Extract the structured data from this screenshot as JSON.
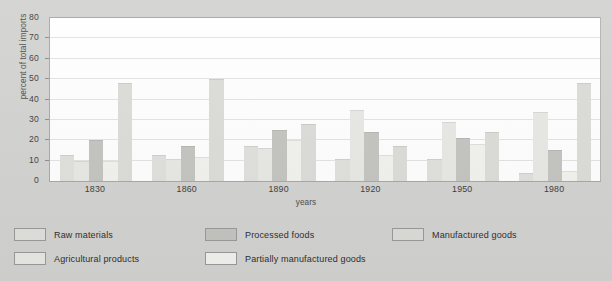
{
  "chart_data": {
    "type": "bar",
    "title": "",
    "subtitle": "",
    "xlabel": "years",
    "ylabel": "percent of total imports",
    "categories": [
      "1830",
      "1860",
      "1890",
      "1920",
      "1950",
      "1980"
    ],
    "ylim": [
      0,
      80
    ],
    "yticks": [
      0,
      10,
      20,
      30,
      40,
      50,
      60,
      70,
      80
    ],
    "ytick_labels": [
      "0",
      "10",
      "20",
      "30",
      "40",
      "50",
      "60",
      "70",
      "80"
    ],
    "grid": "horizontal",
    "legend_position": "below-plot",
    "series": [
      {
        "name": "Raw materials",
        "color": "#e0e0dc",
        "values": [
          13,
          13,
          17,
          11,
          11,
          4
        ]
      },
      {
        "name": "Agricultural products",
        "color": "#e8e8e4",
        "values": [
          10,
          11,
          16,
          35,
          29,
          34
        ]
      },
      {
        "name": "Processed foods",
        "color": "#c4c4c0",
        "values": [
          20,
          17,
          25,
          24,
          21,
          15
        ]
      },
      {
        "name": "Partially manufactured goods",
        "color": "#f2f2ee",
        "values": [
          10,
          12,
          20,
          13,
          18,
          5
        ]
      },
      {
        "name": "Manufactured goods",
        "color": "#dcdcd8",
        "values": [
          48,
          50,
          28,
          17,
          24,
          48
        ]
      }
    ]
  },
  "legend": {
    "items": [
      {
        "label": "Raw materials",
        "color": "#e0e0dc"
      },
      {
        "label": "Agricultural products",
        "color": "#e8e8e4"
      },
      {
        "label": "Processed foods",
        "color": "#c4c4c0"
      },
      {
        "label": "Partially manufactured goods",
        "color": "#f2f2ee"
      },
      {
        "label": "Manufactured goods",
        "color": "#dcdcd8"
      }
    ]
  },
  "colors": {
    "page_background": "#d3d3d1",
    "plot_background": "#ffffff",
    "axis": "#a8a8a6",
    "gridline": "#e4e4e2",
    "text": "#3c3c3c"
  }
}
